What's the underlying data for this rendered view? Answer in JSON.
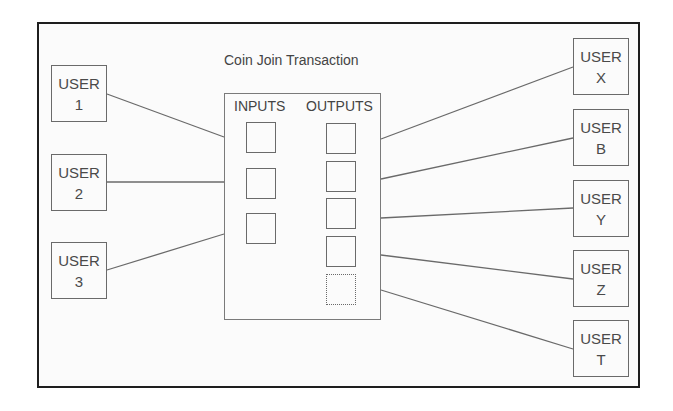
{
  "diagram": {
    "title": "Coin Join Transaction",
    "transaction": {
      "inputs_label": "INPUTS",
      "outputs_label": "OUTPUTS",
      "input_count": 3,
      "output_count": 5
    },
    "senders": [
      {
        "line1": "USER",
        "line2": "1"
      },
      {
        "line1": "USER",
        "line2": "2"
      },
      {
        "line1": "USER",
        "line2": "3"
      }
    ],
    "receivers": [
      {
        "line1": "USER",
        "line2": "X"
      },
      {
        "line1": "USER",
        "line2": "B"
      },
      {
        "line1": "USER",
        "line2": "Y"
      },
      {
        "line1": "USER",
        "line2": "Z"
      },
      {
        "line1": "USER",
        "line2": "T"
      }
    ],
    "colors": {
      "frame": "#1e1e1e",
      "line": "#6a6a6a",
      "text": "#4a4a4a",
      "background": "#fbfbfb"
    }
  }
}
